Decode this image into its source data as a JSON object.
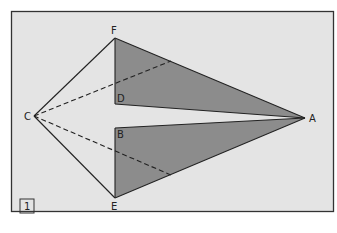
{
  "figure": {
    "number": "1",
    "colors": {
      "background": "#e4e4e4",
      "frame": "#333333",
      "shade": "#8c8c8c",
      "line": "#222222"
    },
    "points": {
      "A": {
        "label": "A",
        "x": 305,
        "y": 118
      },
      "B": {
        "label": "B",
        "x": 115,
        "y": 128
      },
      "C": {
        "label": "C",
        "x": 34,
        "y": 116
      },
      "D": {
        "label": "D",
        "x": 115,
        "y": 104
      },
      "E": {
        "label": "E",
        "x": 115,
        "y": 198
      },
      "F": {
        "label": "F",
        "x": 115,
        "y": 38
      }
    },
    "shaded_triangles": [
      [
        "F",
        "D",
        "A"
      ],
      [
        "B",
        "E",
        "A"
      ]
    ],
    "solid_segments": [
      [
        "C",
        "F"
      ],
      [
        "C",
        "E"
      ],
      [
        "F",
        "A"
      ],
      [
        "E",
        "A"
      ],
      [
        "D",
        "A"
      ],
      [
        "B",
        "A"
      ],
      [
        "F",
        "D"
      ],
      [
        "B",
        "E"
      ]
    ],
    "dashed_segments": [
      [
        "C",
        "FA-mid"
      ],
      [
        "C",
        "EA-mid"
      ]
    ]
  }
}
